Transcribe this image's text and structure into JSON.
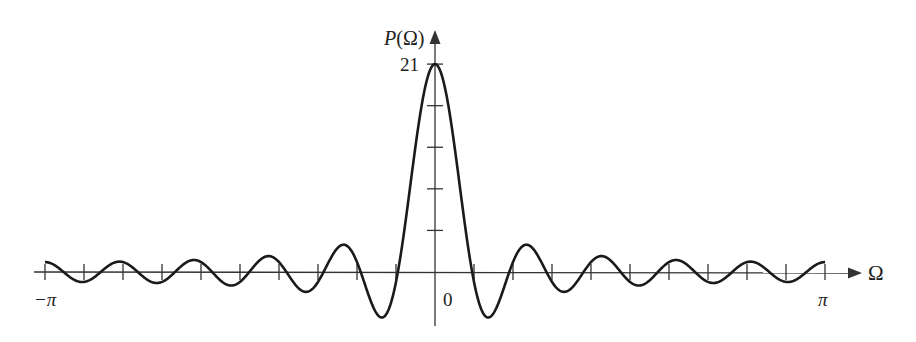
{
  "chart_data": {
    "type": "line",
    "title": "",
    "xlabel": "Ω",
    "ylabel": "P(Ω)",
    "function": "P(Ω) = sin(21Ω/2) / sin(Ω/2)",
    "N": 21,
    "xlim": [
      -3.14159,
      3.14159
    ],
    "ylim": [
      -5,
      21
    ],
    "x_tick_labels": [
      "−π",
      "0",
      "π"
    ],
    "x_ticks_spacing": "π/10",
    "y_tick_labels": [
      "21"
    ],
    "y_ticks_unlabeled": 4,
    "grid": false,
    "legend": null,
    "x_in_units_of_pi": [
      -1.0,
      -0.95,
      -0.9,
      -0.85,
      -0.8,
      -0.75,
      -0.7,
      -0.65,
      -0.6,
      -0.55,
      -0.5,
      -0.45,
      -0.4,
      -0.35,
      -0.3,
      -0.25,
      -0.2,
      -0.15,
      -0.1,
      -0.05,
      0.0,
      0.05,
      0.1,
      0.15,
      0.2,
      0.25,
      0.3,
      0.35,
      0.4,
      0.45,
      0.5,
      0.55,
      0.6,
      0.65,
      0.7,
      0.75,
      0.8,
      0.85,
      0.9,
      0.95,
      1.0
    ],
    "values": [
      1.0,
      -0.08,
      -1.0,
      0.24,
      1.0,
      -0.41,
      -1.0,
      0.61,
      1.0,
      -0.85,
      -1.0,
      1.17,
      1.0,
      -1.63,
      -1.0,
      2.41,
      1.0,
      -4.17,
      -1.0,
      12.7,
      21.0,
      12.7,
      -1.0,
      -4.17,
      1.0,
      2.41,
      -1.0,
      -1.63,
      1.0,
      1.17,
      -1.0,
      -0.85,
      1.0,
      0.61,
      -1.0,
      -0.41,
      1.0,
      0.24,
      -1.0,
      -0.08,
      1.0
    ]
  },
  "labels": {
    "y_axis": "P(Ω)",
    "peak": "21",
    "origin": "0",
    "x_min": "−π",
    "x_max": "π",
    "x_axis": "Ω"
  },
  "style": {
    "curve_color": "#1a1a1a",
    "axis_color": "#333333"
  }
}
